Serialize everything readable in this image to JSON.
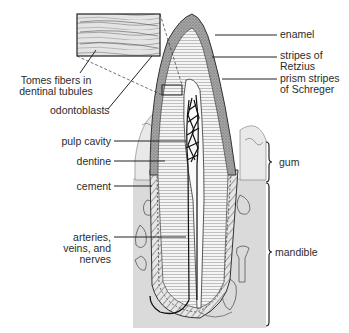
{
  "diagram": {
    "labels": {
      "tomes_fibers": [
        "Tomes fibers in",
        "dentinal tubules"
      ],
      "odontoblasts": "odontoblasts",
      "pulp_cavity": "pulp cavity",
      "dentine": "dentine",
      "cement": "cement",
      "arteries": [
        "arteries,",
        "veins, and",
        "nerves"
      ],
      "enamel": "enamel",
      "retzius": [
        "stripes of",
        "Retzius"
      ],
      "schreger": [
        "prism stripes",
        "of Schreger"
      ],
      "gum": "gum",
      "mandible": "mandible"
    },
    "colors": {
      "line": "#222222",
      "enamel_fill": "#8d8d8d",
      "bone_fill": "#d9d9d9",
      "dentine_fill": "#f2f2f2",
      "background": "#ffffff"
    }
  }
}
